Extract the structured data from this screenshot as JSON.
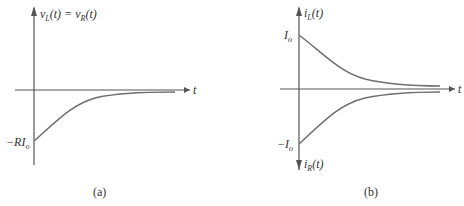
{
  "colors": {
    "axis": "#555555",
    "curve": "#6e6e6e",
    "text": "#333333",
    "background": "#ffffff"
  },
  "panel_a": {
    "y_axis_label": "v_L(t) = v_R(t)",
    "y_axis_label_parts": {
      "v": "v",
      "subL": "L",
      "mid": "(t) = ",
      "v2": "v",
      "subR": "R",
      "end": "(t)"
    },
    "x_axis_label": "t",
    "initial_value_label": "−RI",
    "initial_value_sub": "o",
    "caption": "(a)"
  },
  "panel_b": {
    "y_axis_top_label": "i_L(t)",
    "top_parts": {
      "i": "i",
      "sub": "L",
      "end": "(t)"
    },
    "y_axis_bottom_label": "i_R(t)",
    "bottom_parts": {
      "i": "i",
      "sub": "R",
      "end": "(t)"
    },
    "x_axis_label": "t",
    "positive_value_label": "I",
    "positive_value_sub": "o",
    "negative_value_label": "−I",
    "negative_value_sub": "o",
    "caption": "(b)"
  }
}
